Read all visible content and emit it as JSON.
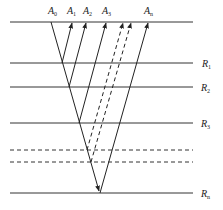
{
  "diagram": {
    "type": "multi-layer reflection ray diagram",
    "top_labels": [
      {
        "id": "A0",
        "base": "A",
        "sub": "0"
      },
      {
        "id": "A1",
        "base": "A",
        "sub": "1"
      },
      {
        "id": "A2",
        "base": "A",
        "sub": "2"
      },
      {
        "id": "A3",
        "base": "A",
        "sub": "3"
      },
      {
        "id": "An",
        "base": "A",
        "sub": "n"
      }
    ],
    "layer_labels": [
      {
        "id": "R1",
        "base": "R",
        "sub": "1"
      },
      {
        "id": "R2",
        "base": "R",
        "sub": "2"
      },
      {
        "id": "R3",
        "base": "R",
        "sub": "3"
      },
      {
        "id": "Rn",
        "base": "R",
        "sub": "n"
      }
    ],
    "colors": {
      "line": "#333333",
      "background": "#ffffff"
    }
  }
}
